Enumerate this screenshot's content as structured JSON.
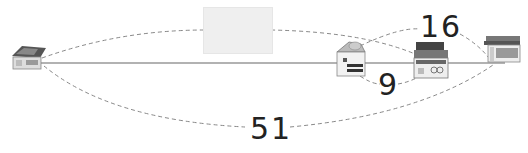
{
  "diagram": {
    "type": "distance-diagram",
    "main_line_color": "#555555",
    "dashed_color": "#888888",
    "nodes": [
      {
        "id": "start",
        "icon": "house-icon",
        "x": 28,
        "y": 63
      },
      {
        "id": "mid1",
        "icon": "shop-icon",
        "x": 352,
        "y": 64
      },
      {
        "id": "mid2",
        "icon": "store-icon",
        "x": 428,
        "y": 64
      },
      {
        "id": "end",
        "icon": "storefront-icon",
        "x": 506,
        "y": 52
      }
    ],
    "labels": {
      "top": "16",
      "middle": "9",
      "bottom": "51"
    },
    "hidden_label_box": true
  }
}
